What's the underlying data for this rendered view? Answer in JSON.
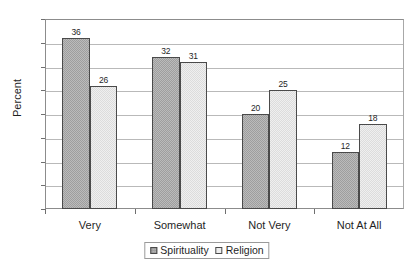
{
  "chart_data": {
    "type": "bar",
    "title": "",
    "xlabel": "",
    "ylabel": "Percent",
    "categories": [
      "Very",
      "Somewhat",
      "Not Very",
      "Not At All"
    ],
    "series": [
      {
        "name": "Spirituality",
        "values": [
          36,
          32,
          20,
          12
        ],
        "color": "#9e9e9e"
      },
      {
        "name": "Religion",
        "values": [
          26,
          31,
          25,
          18
        ],
        "color": "#dcdcdc"
      }
    ],
    "ylim": [
      0,
      40
    ],
    "ytick_step": 5,
    "yticks": [
      0,
      5,
      10,
      15,
      20,
      25,
      30,
      35,
      40
    ],
    "ytick_labels": [
      "0",
      "5",
      "10",
      "15",
      "20",
      "25",
      "30",
      "35",
      "40"
    ],
    "grid": true,
    "grid_axis": "y",
    "legend_position": "bottom",
    "data_labels": true
  }
}
